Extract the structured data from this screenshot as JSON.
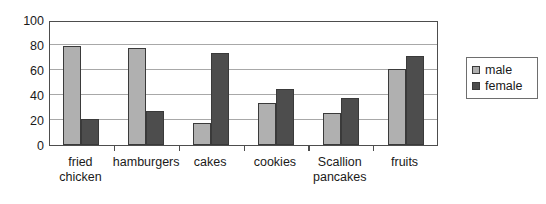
{
  "chart_data": {
    "type": "bar",
    "title": "",
    "subtitle": "",
    "xlabel": "",
    "ylabel": "",
    "ylim": [
      0,
      100
    ],
    "y_ticks": [
      0,
      20,
      40,
      60,
      80,
      100
    ],
    "grid": true,
    "legend_position": "right",
    "categories": [
      "fried chicken",
      "hamburgers",
      "cakes",
      "cookies",
      "Scallion\npancakes",
      "fruits"
    ],
    "series": [
      {
        "name": "male",
        "color": "#b0b0b0",
        "values": [
          79,
          78,
          18,
          34,
          26,
          61
        ]
      },
      {
        "name": "female",
        "color": "#4d4d4d",
        "values": [
          21,
          27,
          74,
          45,
          38,
          71
        ]
      }
    ]
  },
  "legend": {
    "items": [
      {
        "label": "male",
        "swatch": "legend-swatch-male"
      },
      {
        "label": "female",
        "swatch": "legend-swatch-female"
      }
    ]
  },
  "axes": {
    "y_tick_labels": [
      "100",
      "80",
      "60",
      "40",
      "20",
      "0"
    ]
  }
}
